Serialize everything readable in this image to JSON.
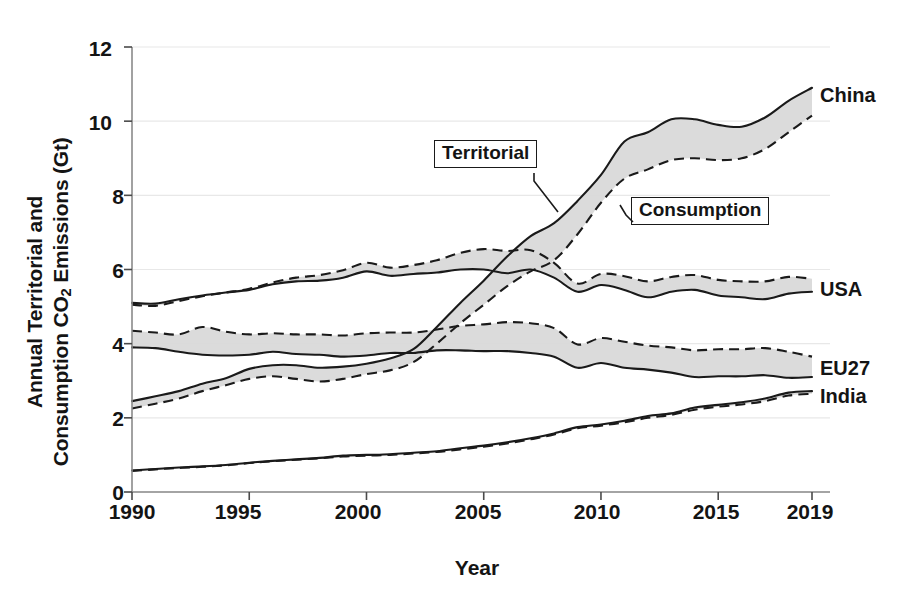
{
  "axes": {
    "ylabel_line1": "Annual Territorial and",
    "ylabel_line2_pre": "Consumption CO",
    "ylabel_line2_sub": "2",
    "ylabel_line2_post": " Emissions (Gt)",
    "ylabel_full": "Annual Territorial and Consumption CO2 Emissions (Gt)",
    "xlabel": "Year",
    "ytick_labels": [
      "0",
      "2",
      "4",
      "6",
      "8",
      "10",
      "12"
    ],
    "xtick_labels": [
      "1990",
      "1995",
      "2000",
      "2005",
      "2010",
      "2015",
      "2019"
    ]
  },
  "annotations": {
    "territorial": "Territorial",
    "consumption": "Consumption"
  },
  "series_labels": {
    "china": "China",
    "usa": "USA",
    "eu27": "EU27",
    "india": "India"
  },
  "colors": {
    "line": "#1a1a1a",
    "band_fill": "#d9d9d9",
    "grid": "#e8e8e8",
    "background": "#ffffff"
  },
  "chart_data": {
    "type": "line",
    "title": "",
    "subtitle": "",
    "xlabel": "Year",
    "ylabel": "Annual Territorial and Consumption CO2 Emissions (Gt)",
    "xlim": [
      1990,
      2019
    ],
    "ylim": [
      0,
      12
    ],
    "yticks": [
      0,
      2,
      4,
      6,
      8,
      10,
      12
    ],
    "xticks": [
      1990,
      1995,
      2000,
      2005,
      2010,
      2015,
      2019
    ],
    "grid": "faint horizontal gridlines",
    "legend": "inline right-edge series labels (China, USA, EU27, India) plus boxed callouts 'Territorial' (solid line) and 'Consumption' (dashed line)",
    "line_styles": {
      "Territorial": "solid",
      "Consumption": "dashed"
    },
    "band_note": "Each country is drawn as a shaded band between its Territorial (solid) and Consumption (dashed) emission curves.",
    "x": [
      1990,
      1991,
      1992,
      1993,
      1994,
      1995,
      1996,
      1997,
      1998,
      1999,
      2000,
      2001,
      2002,
      2003,
      2004,
      2005,
      2006,
      2007,
      2008,
      2009,
      2010,
      2011,
      2012,
      2013,
      2014,
      2015,
      2016,
      2017,
      2018,
      2019
    ],
    "series": [
      {
        "name": "China Territorial",
        "country": "China",
        "style": "solid",
        "values": [
          2.45,
          2.58,
          2.72,
          2.92,
          3.07,
          3.32,
          3.42,
          3.42,
          3.35,
          3.38,
          3.46,
          3.6,
          3.85,
          4.45,
          5.1,
          5.7,
          6.35,
          6.9,
          7.25,
          7.85,
          8.55,
          9.45,
          9.7,
          10.05,
          10.05,
          9.9,
          9.85,
          10.1,
          10.55,
          10.9
        ]
      },
      {
        "name": "China Consumption",
        "country": "China",
        "style": "dashed",
        "values": [
          2.25,
          2.38,
          2.52,
          2.72,
          2.88,
          3.05,
          3.12,
          3.05,
          2.98,
          3.05,
          3.18,
          3.28,
          3.5,
          4.0,
          4.55,
          5.05,
          5.55,
          5.95,
          6.25,
          6.95,
          7.8,
          8.45,
          8.7,
          8.95,
          9.0,
          8.95,
          9.0,
          9.25,
          9.7,
          10.15
        ]
      },
      {
        "name": "USA Territorial",
        "country": "USA",
        "style": "solid",
        "values": [
          5.1,
          5.08,
          5.2,
          5.3,
          5.38,
          5.45,
          5.6,
          5.68,
          5.7,
          5.78,
          5.95,
          5.83,
          5.88,
          5.92,
          6.0,
          6.0,
          5.9,
          6.0,
          5.78,
          5.4,
          5.58,
          5.45,
          5.25,
          5.4,
          5.45,
          5.3,
          5.25,
          5.2,
          5.35,
          5.4
        ]
      },
      {
        "name": "USA Consumption",
        "country": "USA",
        "style": "dashed",
        "values": [
          5.05,
          5.02,
          5.15,
          5.28,
          5.38,
          5.48,
          5.65,
          5.78,
          5.85,
          5.98,
          6.18,
          6.05,
          6.12,
          6.25,
          6.45,
          6.55,
          6.5,
          6.52,
          6.18,
          5.62,
          5.88,
          5.82,
          5.68,
          5.8,
          5.85,
          5.72,
          5.68,
          5.68,
          5.8,
          5.75
        ]
      },
      {
        "name": "EU27 Territorial",
        "country": "EU27",
        "style": "solid",
        "values": [
          3.9,
          3.88,
          3.78,
          3.7,
          3.68,
          3.7,
          3.78,
          3.72,
          3.7,
          3.65,
          3.68,
          3.75,
          3.75,
          3.82,
          3.82,
          3.8,
          3.8,
          3.75,
          3.65,
          3.35,
          3.48,
          3.35,
          3.3,
          3.22,
          3.1,
          3.12,
          3.12,
          3.15,
          3.08,
          3.1
        ]
      },
      {
        "name": "EU27 Consumption",
        "country": "EU27",
        "style": "dashed",
        "values": [
          4.35,
          4.3,
          4.25,
          4.45,
          4.32,
          4.25,
          4.28,
          4.25,
          4.25,
          4.22,
          4.28,
          4.3,
          4.3,
          4.38,
          4.48,
          4.52,
          4.58,
          4.55,
          4.42,
          3.98,
          4.15,
          4.05,
          3.95,
          3.9,
          3.82,
          3.85,
          3.85,
          3.88,
          3.78,
          3.65
        ]
      },
      {
        "name": "India Territorial",
        "country": "India",
        "style": "solid",
        "values": [
          0.58,
          0.62,
          0.66,
          0.69,
          0.73,
          0.79,
          0.84,
          0.88,
          0.92,
          0.98,
          1.0,
          1.02,
          1.06,
          1.1,
          1.18,
          1.25,
          1.34,
          1.45,
          1.58,
          1.75,
          1.82,
          1.92,
          2.05,
          2.12,
          2.28,
          2.35,
          2.42,
          2.52,
          2.68,
          2.72
        ]
      },
      {
        "name": "India Consumption",
        "country": "India",
        "style": "dashed",
        "values": [
          0.57,
          0.61,
          0.65,
          0.68,
          0.72,
          0.78,
          0.83,
          0.87,
          0.91,
          0.96,
          0.98,
          1.0,
          1.04,
          1.08,
          1.15,
          1.22,
          1.31,
          1.42,
          1.55,
          1.72,
          1.79,
          1.88,
          2.0,
          2.08,
          2.22,
          2.3,
          2.36,
          2.45,
          2.6,
          2.65
        ]
      }
    ]
  }
}
